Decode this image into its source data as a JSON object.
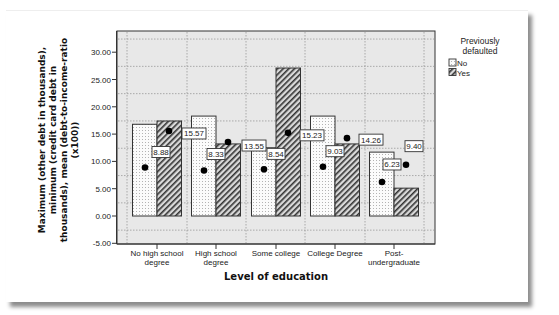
{
  "chart_data": {
    "type": "bar",
    "title": "",
    "xlabel": "Level of education",
    "ylabel_lines": [
      "Maximum (other debt in thousands),",
      "minimum (credit card debt in",
      "thousands), mean (debt-to-income-ratio",
      "(x100))"
    ],
    "categories": [
      [
        "No high school",
        "degree"
      ],
      [
        "High school",
        "degree"
      ],
      [
        "Some college"
      ],
      [
        "College Degree"
      ],
      [
        "Post-",
        "undergraduate"
      ]
    ],
    "ylim": [
      -5,
      32.5
    ],
    "yticks": [
      -5,
      0,
      5,
      10,
      15,
      20,
      25,
      30
    ],
    "ytick_labels": [
      "-5.00",
      "0.00",
      "5.00",
      "10.00",
      "15.00",
      "20.00",
      "25.00",
      "30.00"
    ],
    "grid": true,
    "legend": {
      "title_lines": [
        "Previously",
        "defaulted"
      ],
      "position": "right",
      "entries": [
        {
          "name": "No",
          "pattern": "dotted"
        },
        {
          "name": "Yes",
          "pattern": "hatched"
        }
      ]
    },
    "series": [
      {
        "name": "No",
        "pattern": "dotted",
        "max_values": [
          16.8,
          18.3,
          12.5,
          18.3,
          11.7
        ],
        "min_values": [
          0,
          0,
          0,
          0,
          0
        ],
        "mean_values": [
          8.88,
          8.33,
          8.54,
          9.03,
          6.23
        ],
        "mean_labels": [
          "8.88",
          "8.33",
          "8.54",
          "9.03",
          "6.23"
        ]
      },
      {
        "name": "Yes",
        "pattern": "hatched",
        "max_values": [
          17.4,
          13.2,
          27.1,
          13.2,
          5.1
        ],
        "min_values": [
          0,
          0,
          0,
          0,
          0
        ],
        "mean_values": [
          15.57,
          13.55,
          15.23,
          14.26,
          9.4
        ],
        "mean_labels": [
          "15.57",
          "13.55",
          "15.23",
          "14.26",
          "9.40"
        ]
      }
    ]
  }
}
